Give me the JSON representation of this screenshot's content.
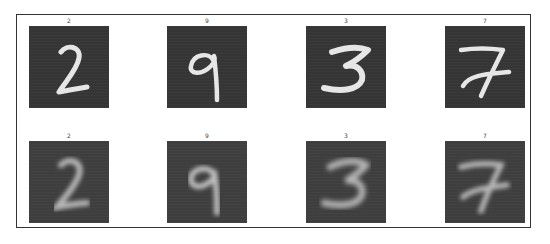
{
  "figure": {
    "rows": [
      {
        "name": "original",
        "tiles": [
          {
            "label": "2",
            "digit": "2"
          },
          {
            "label": "9",
            "digit": "9"
          },
          {
            "label": "3",
            "digit": "3"
          },
          {
            "label": "7",
            "digit": "7"
          }
        ]
      },
      {
        "name": "reconstruction",
        "tiles": [
          {
            "label": "2",
            "digit": "2"
          },
          {
            "label": "9",
            "digit": "9"
          },
          {
            "label": "3",
            "digit": "3"
          },
          {
            "label": "7",
            "digit": "7"
          }
        ]
      }
    ]
  },
  "colors": {
    "tile_background": "#353535",
    "stroke_sharp": "#e6e6e6",
    "stroke_blurry": "#b5b5b5",
    "frame_border": "#333333"
  }
}
